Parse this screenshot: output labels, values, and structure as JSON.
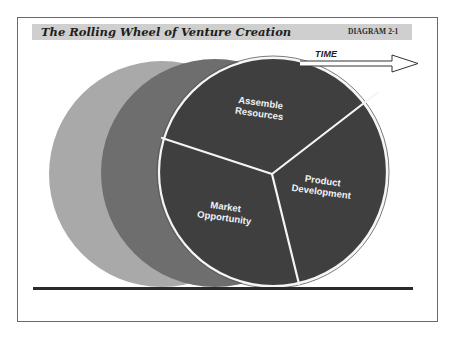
{
  "header": {
    "title": "The Rolling Wheel of Venture Creation",
    "diagram_id": "DIAGRAM 2-1"
  },
  "arrow": {
    "label": "TIME"
  },
  "wheel": {
    "segments": [
      {
        "line1": "Assemble",
        "line2": "Resources"
      },
      {
        "line1": "Product",
        "line2": "Development"
      },
      {
        "line1": "Market",
        "line2": "Opportunity"
      }
    ]
  },
  "colors": {
    "ghost_light": "#a9a9a9",
    "ghost_mid": "#6e6e6e",
    "wheel": "#3f3f3f",
    "spokes": "#f5f5f5",
    "ground": "#2b2b2b",
    "titlebar": "#cfcfcf"
  }
}
